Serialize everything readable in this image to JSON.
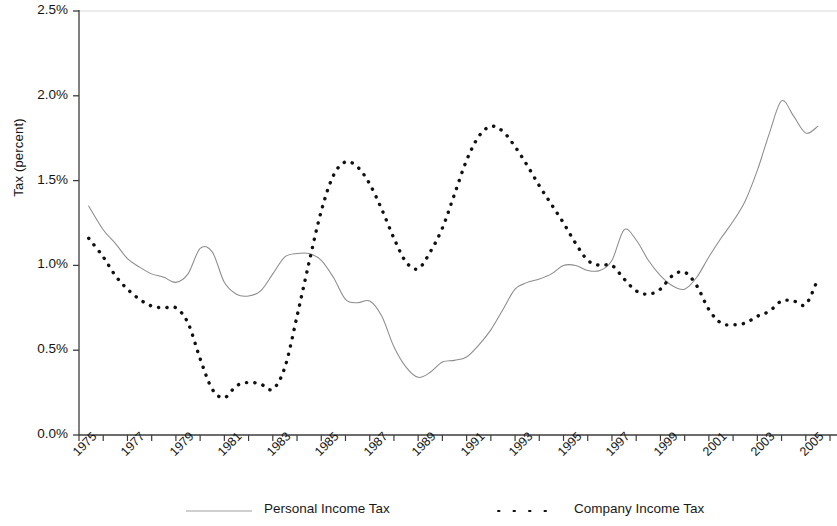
{
  "chart_data": {
    "type": "line",
    "title": "",
    "xlabel": "",
    "ylabel": "Tax (percent)",
    "ylim": [
      0.0,
      2.5
    ],
    "ytick_labels": [
      "0.0%",
      "0.5%",
      "1.0%",
      "1.5%",
      "2.0%",
      "2.5%"
    ],
    "ytick_values": [
      0.0,
      0.5,
      1.0,
      1.5,
      2.0,
      2.5
    ],
    "xlim": [
      1975,
      2006
    ],
    "xtick_labels": [
      "1975",
      "1977",
      "1979",
      "1981",
      "1983",
      "1985",
      "1987",
      "1989",
      "1991",
      "1993",
      "1995",
      "1997",
      "1999",
      "2001",
      "2003",
      "2005"
    ],
    "xtick_values": [
      1975,
      1977,
      1979,
      1981,
      1983,
      1985,
      1987,
      1989,
      1991,
      1993,
      1995,
      1997,
      1999,
      2001,
      2003,
      2005
    ],
    "grid": false,
    "legend_position": "bottom",
    "x": [
      1975.4,
      1976,
      1976.5,
      1977,
      1977.5,
      1978,
      1978.5,
      1979,
      1979.5,
      1980,
      1980.5,
      1981,
      1981.5,
      1982,
      1982.5,
      1983,
      1983.5,
      1984,
      1984.5,
      1985,
      1985.5,
      1986,
      1986.5,
      1987,
      1987.5,
      1988,
      1988.5,
      1989,
      1989.5,
      1990,
      1990.5,
      1991,
      1991.5,
      1992,
      1992.5,
      1993,
      1993.5,
      1994,
      1994.5,
      1995,
      1995.5,
      1996,
      1996.5,
      1997,
      1997.5,
      1998,
      1998.5,
      1999,
      1999.5,
      2000,
      2000.5,
      2001,
      2001.5,
      2002,
      2002.5,
      2003,
      2003.5,
      2004,
      2004.5,
      2005,
      2005.5
    ],
    "series": [
      {
        "name": "Personal Income Tax",
        "style": "solid",
        "color": "#8c8c8c",
        "values": [
          1.35,
          1.21,
          1.13,
          1.04,
          0.99,
          0.95,
          0.93,
          0.9,
          0.95,
          1.1,
          1.08,
          0.9,
          0.83,
          0.82,
          0.85,
          0.95,
          1.05,
          1.07,
          1.07,
          1.03,
          0.93,
          0.8,
          0.78,
          0.79,
          0.7,
          0.52,
          0.4,
          0.34,
          0.37,
          0.43,
          0.44,
          0.46,
          0.53,
          0.62,
          0.74,
          0.86,
          0.9,
          0.92,
          0.95,
          1.0,
          1.0,
          0.97,
          0.97,
          1.03,
          1.21,
          1.15,
          1.03,
          0.94,
          0.88,
          0.86,
          0.93,
          1.05,
          1.16,
          1.26,
          1.38,
          1.56,
          1.78,
          1.97,
          1.88,
          1.78,
          1.82
        ]
      },
      {
        "name": "Company Income Tax",
        "style": "dashed",
        "color": "#111111",
        "values": [
          1.16,
          1.05,
          0.94,
          0.86,
          0.8,
          0.76,
          0.75,
          0.75,
          0.66,
          0.45,
          0.27,
          0.22,
          0.29,
          0.31,
          0.3,
          0.27,
          0.4,
          0.7,
          1.02,
          1.32,
          1.53,
          1.61,
          1.58,
          1.48,
          1.33,
          1.16,
          1.02,
          0.98,
          1.08,
          1.22,
          1.42,
          1.62,
          1.76,
          1.82,
          1.79,
          1.7,
          1.59,
          1.47,
          1.36,
          1.25,
          1.13,
          1.03,
          1.0,
          1.0,
          0.92,
          0.85,
          0.83,
          0.86,
          0.94,
          0.96,
          0.88,
          0.74,
          0.66,
          0.65,
          0.66,
          0.7,
          0.73,
          0.79,
          0.79,
          0.77,
          0.92
        ]
      }
    ]
  },
  "axis": {
    "y_title": "Tax (percent)"
  },
  "legend": {
    "entries": [
      {
        "label": "Personal Income Tax",
        "icon": "solid-line-swatch"
      },
      {
        "label": "Company Income Tax",
        "icon": "dashed-line-swatch"
      }
    ]
  }
}
